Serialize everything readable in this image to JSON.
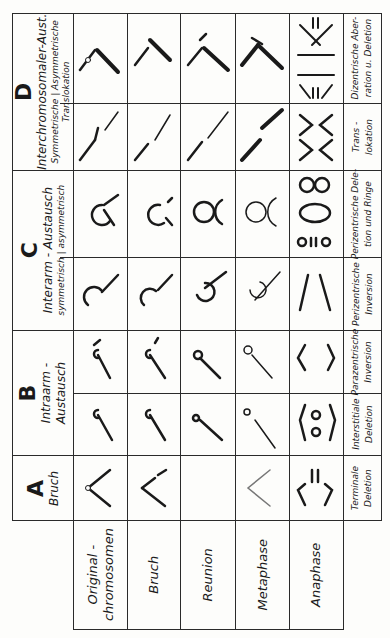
{
  "groups": [
    {
      "letter": "D",
      "title": "Interchromosomaler-Aust.",
      "sub_left": "Symmetrische",
      "sub_right": "Asymmetrische",
      "sub_bottom": "Translokation",
      "columns": [
        {
          "label": "asymmetrisch",
          "result_1": "Dizentrische Aber-",
          "result_2": "ration u. Deletion"
        },
        {
          "label": "symmetrisch",
          "result_1": "Trans -",
          "result_2": "lokation"
        }
      ]
    },
    {
      "letter": "C",
      "title": "Interarm - Austausch",
      "sub_left": "symmetrisch",
      "sub_right": "asymmetrisch",
      "columns": [
        {
          "label": "asymmetrisch",
          "result_1": "Perizentrische Dele-",
          "result_2": "tion und  Ringe"
        },
        {
          "label": "symmetrisch",
          "result_1": "Perizentrische",
          "result_2": "Inversion"
        }
      ]
    },
    {
      "letter": "B",
      "title": "Intraarm -",
      "title2": "Austausch",
      "columns": [
        {
          "result_1": "Parazentrische",
          "result_2": "Inversion"
        },
        {
          "result_1": "Interstitiale",
          "result_2": "Deletion"
        }
      ]
    },
    {
      "letter": "A",
      "title": "Bruch",
      "columns": [
        {
          "result_1": "Terminale",
          "result_2": "Deletion"
        }
      ]
    }
  ],
  "stages": [
    {
      "label_1": "Original -",
      "label_2": "chromosomen"
    },
    {
      "label_1": "Bruch"
    },
    {
      "label_1": "Reunion"
    },
    {
      "label_1": "Metaphase"
    },
    {
      "label_1": "Anaphase"
    }
  ],
  "icons": {
    "chromosome": "chromosome-diagram",
    "ring": "ring-chromosome",
    "dicentric": "dicentric-bridge"
  },
  "colors": {
    "line": "#2a2a2a",
    "ink": "#1a1a1a",
    "paper": "#fdfdfb"
  }
}
